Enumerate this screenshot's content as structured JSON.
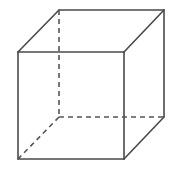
{
  "diagram": {
    "type": "wireframe-cube",
    "colors": {
      "edge": "#4a4a4a",
      "hidden_edge": "#555555",
      "background": "#ffffff"
    },
    "vertices": {
      "front_top_left": [
        18,
        52
      ],
      "front_top_right": [
        124,
        52
      ],
      "front_bottom_right": [
        124,
        159
      ],
      "front_bottom_left": [
        18,
        159
      ],
      "back_top_left": [
        59,
        10
      ],
      "back_top_right": [
        164,
        10
      ],
      "back_bottom_right": [
        164,
        117
      ],
      "back_bottom_left": [
        59,
        117
      ]
    },
    "visible_edges": [
      [
        "front_top_left",
        "front_top_right"
      ],
      [
        "front_top_right",
        "front_bottom_right"
      ],
      [
        "front_bottom_right",
        "front_bottom_left"
      ],
      [
        "front_bottom_left",
        "front_top_left"
      ],
      [
        "back_top_left",
        "back_top_right"
      ],
      [
        "back_top_right",
        "back_bottom_right"
      ],
      [
        "front_top_left",
        "back_top_left"
      ],
      [
        "front_top_right",
        "back_top_right"
      ],
      [
        "front_bottom_right",
        "back_bottom_right"
      ]
    ],
    "hidden_edges": [
      [
        "back_top_left",
        "back_bottom_left"
      ],
      [
        "back_bottom_left",
        "back_bottom_right"
      ],
      [
        "back_bottom_left",
        "front_bottom_left"
      ]
    ]
  }
}
